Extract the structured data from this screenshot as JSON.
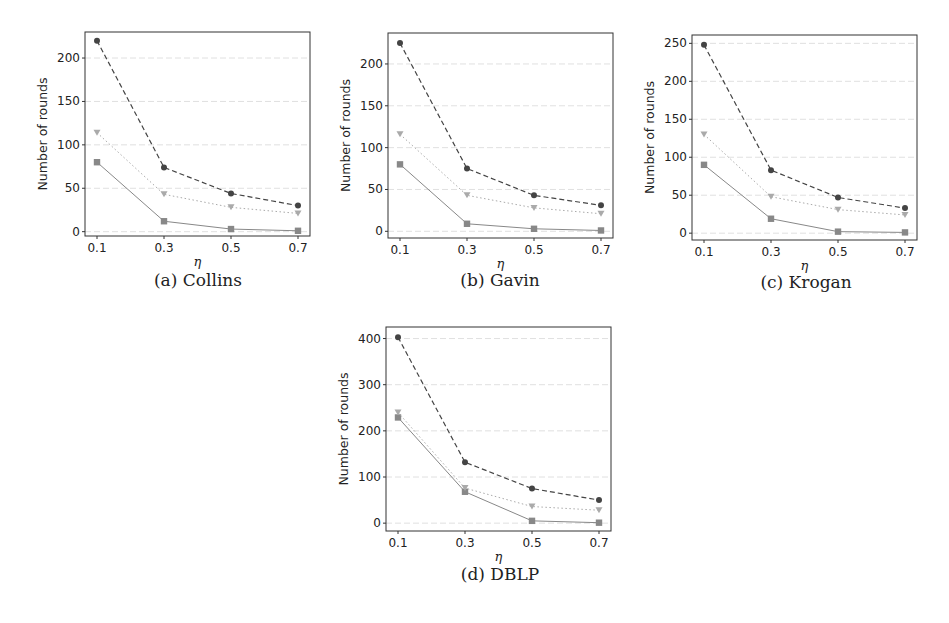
{
  "figure": {
    "captions": [
      "(a) Collins",
      "(b) Gavin",
      "(c) Krogan",
      "(d) DBLP"
    ]
  },
  "chart_data": [
    {
      "type": "line",
      "title": "(a) Collins",
      "xlabel": "η",
      "ylabel": "Number of rounds",
      "x": [
        0.1,
        0.3,
        0.5,
        0.7
      ],
      "xticks": [
        "0.1",
        "0.3",
        "0.5",
        "0.7"
      ],
      "yticks": [
        0,
        50,
        100,
        150,
        200
      ],
      "ylim": [
        -5,
        230
      ],
      "grid": true,
      "legend": null,
      "series": [
        {
          "name": "circle-dashed",
          "marker": "circle",
          "linestyle": "dashed",
          "color": "#444444",
          "values": [
            220,
            74,
            44,
            30
          ]
        },
        {
          "name": "triangle-dotted",
          "marker": "triangle-down",
          "linestyle": "dotted",
          "color": "#aaaaaa",
          "values": [
            114,
            43,
            28,
            21
          ]
        },
        {
          "name": "square-solid",
          "marker": "square",
          "linestyle": "solid",
          "color": "#888888",
          "values": [
            80,
            12,
            3,
            1
          ]
        }
      ]
    },
    {
      "type": "line",
      "title": "(b) Gavin",
      "xlabel": "η",
      "ylabel": "Number of rounds",
      "x": [
        0.1,
        0.3,
        0.5,
        0.7
      ],
      "xticks": [
        "0.1",
        "0.3",
        "0.5",
        "0.7"
      ],
      "yticks": [
        0,
        50,
        100,
        150,
        200
      ],
      "ylim": [
        -8,
        237
      ],
      "grid": true,
      "legend": null,
      "series": [
        {
          "name": "circle-dashed",
          "marker": "circle",
          "linestyle": "dashed",
          "color": "#444444",
          "values": [
            225,
            75,
            43,
            31
          ]
        },
        {
          "name": "triangle-dotted",
          "marker": "triangle-down",
          "linestyle": "dotted",
          "color": "#aaaaaa",
          "values": [
            116,
            43,
            28,
            21
          ]
        },
        {
          "name": "square-solid",
          "marker": "square",
          "linestyle": "solid",
          "color": "#888888",
          "values": [
            80,
            9,
            3,
            1
          ]
        }
      ]
    },
    {
      "type": "line",
      "title": "(c) Krogan",
      "xlabel": "η",
      "ylabel": "Number of rounds",
      "x": [
        0.1,
        0.3,
        0.5,
        0.7
      ],
      "xticks": [
        "0.1",
        "0.3",
        "0.5",
        "0.7"
      ],
      "yticks": [
        0,
        50,
        100,
        150,
        200,
        250
      ],
      "ylim": [
        -9,
        261
      ],
      "grid": true,
      "legend": null,
      "series": [
        {
          "name": "circle-dashed",
          "marker": "circle",
          "linestyle": "dashed",
          "color": "#444444",
          "values": [
            248,
            83,
            47,
            33
          ]
        },
        {
          "name": "triangle-dotted",
          "marker": "triangle-down",
          "linestyle": "dotted",
          "color": "#aaaaaa",
          "values": [
            130,
            48,
            31,
            24
          ]
        },
        {
          "name": "square-solid",
          "marker": "square",
          "linestyle": "solid",
          "color": "#888888",
          "values": [
            90,
            19,
            2,
            1
          ]
        }
      ]
    },
    {
      "type": "line",
      "title": "(d) DBLP",
      "xlabel": "η",
      "ylabel": "Number of rounds",
      "x": [
        0.1,
        0.3,
        0.5,
        0.7
      ],
      "xticks": [
        "0.1",
        "0.3",
        "0.5",
        "0.7"
      ],
      "yticks": [
        0,
        100,
        200,
        300,
        400
      ],
      "ylim": [
        -17,
        425
      ],
      "grid": true,
      "legend": null,
      "series": [
        {
          "name": "circle-dashed",
          "marker": "circle",
          "linestyle": "dashed",
          "color": "#444444",
          "values": [
            403,
            132,
            75,
            50
          ]
        },
        {
          "name": "triangle-dotted",
          "marker": "triangle-down",
          "linestyle": "dotted",
          "color": "#aaaaaa",
          "values": [
            240,
            76,
            36,
            28
          ]
        },
        {
          "name": "square-solid",
          "marker": "square",
          "linestyle": "solid",
          "color": "#888888",
          "values": [
            229,
            68,
            5,
            1
          ]
        }
      ]
    }
  ]
}
